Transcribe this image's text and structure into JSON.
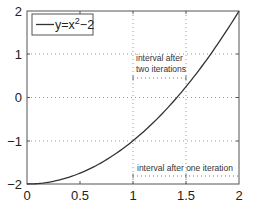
{
  "chart_data": {
    "type": "line",
    "title": "",
    "xlabel": "",
    "ylabel": "",
    "xlim": [
      0,
      2
    ],
    "ylim": [
      -2,
      2
    ],
    "x_ticks": [
      "0",
      "0.5",
      "1",
      "1.5",
      "2"
    ],
    "y_ticks": [
      "2",
      "1",
      "0",
      "-1",
      "-2"
    ],
    "grid": {
      "horizontal_dotted_at_y": [
        1,
        0,
        -1
      ],
      "vertical_dotted_at_x": [
        1,
        1.5
      ]
    },
    "legend": {
      "position": "upper-left",
      "entries": [
        {
          "label_base": "y=x",
          "label_sup": "2",
          "label_tail": "−2",
          "style": "solid"
        }
      ]
    },
    "series": [
      {
        "name": "y=x^2-2",
        "function": "x^2 - 2",
        "x": [
          0,
          0.25,
          0.5,
          0.75,
          1,
          1.25,
          1.5,
          1.75,
          2
        ],
        "y": [
          -2,
          -1.9375,
          -1.75,
          -1.4375,
          -1,
          -0.4375,
          0.25,
          1.0625,
          2
        ]
      }
    ],
    "annotations": [
      {
        "text_line1": "interval after",
        "text_line2": "two iterations",
        "interval": [
          1,
          1.5
        ],
        "marker_y": 0.45
      },
      {
        "text_line1": "interval after one iteration",
        "interval": [
          1,
          2
        ],
        "marker_y": -1.8
      }
    ]
  },
  "labels": {
    "x_ticks": [
      "0",
      "0.5",
      "1",
      "1.5",
      "2"
    ],
    "y_ticks": [
      "2",
      "1",
      "0",
      "−1",
      "−2"
    ],
    "legend_base": "y=x",
    "legend_sup": "2",
    "legend_tail": "−2",
    "annot_two_line1": "interval after",
    "annot_two_line2": "two iterations",
    "annot_one": "interval after one iteration"
  }
}
